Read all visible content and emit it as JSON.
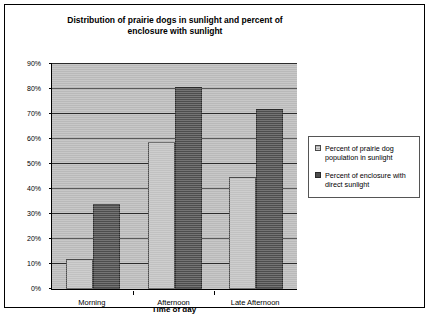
{
  "chart_data": {
    "type": "bar",
    "title": "Distribution of prairie dogs in sunlight and percent of enclosure with sunlight",
    "xlabel": "Time of day",
    "ylabel": "",
    "categories": [
      "Morning",
      "Afternoon",
      "Late Afternoon"
    ],
    "series": [
      {
        "name": "Percent of prairie dog population in sunlight",
        "values": [
          12,
          59,
          45
        ],
        "color": "#b0b0b0"
      },
      {
        "name": "Percent of enclosure with direct sunlight",
        "values": [
          34,
          81,
          72
        ],
        "color": "#4d4d4d"
      }
    ],
    "ylim": [
      0,
      90
    ],
    "ytick_labels": [
      "90%",
      "80%",
      "70%",
      "60%",
      "50%",
      "40%",
      "30%",
      "20%",
      "10%",
      "0%"
    ],
    "ytick_values": [
      90,
      80,
      70,
      60,
      50,
      40,
      30,
      20,
      10,
      0
    ],
    "grid": true,
    "legend_position": "right",
    "plot_background": "#b9b9b9"
  }
}
